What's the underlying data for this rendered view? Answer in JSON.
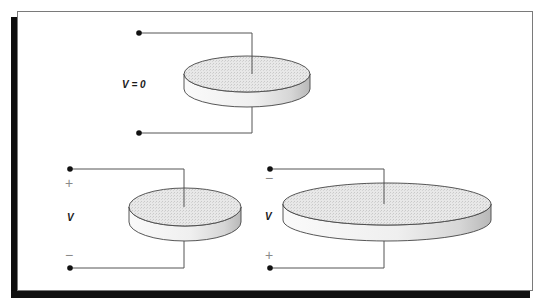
{
  "diagram": {
    "colors": {
      "frame_border": "#7a7a7a",
      "shadow": "#111111",
      "wire": "#555555",
      "terminal_dot": "#111111",
      "disk_top_fill": "#e4e4e4",
      "disk_side_fill": "#f4f4f4",
      "disk_side_shade": "#bdbdbd",
      "disk_outline": "#444444",
      "label": "#1a1a1a",
      "sign": "#8a8a8a"
    },
    "panels": [
      {
        "id": "top",
        "voltage_label": "V = 0",
        "top_sign": "",
        "bottom_sign": "",
        "disk": {
          "cx": 247,
          "cy": 74,
          "rx": 63,
          "ry": 18,
          "thickness": 15
        },
        "wire_x": 252,
        "top_terminal": {
          "x": 139,
          "y": 33
        },
        "bottom_terminal": {
          "x": 139,
          "y": 133
        }
      },
      {
        "id": "bottom-left",
        "voltage_label": "V",
        "top_sign": "+",
        "bottom_sign": "−",
        "disk": {
          "cx": 185,
          "cy": 207,
          "rx": 56,
          "ry": 19,
          "thickness": 15
        },
        "wire_x": 184,
        "top_terminal": {
          "x": 70,
          "y": 169
        },
        "bottom_terminal": {
          "x": 70,
          "y": 268
        }
      },
      {
        "id": "bottom-right",
        "voltage_label": "V",
        "top_sign": "−",
        "bottom_sign": "+",
        "disk": {
          "cx": 387,
          "cy": 204,
          "rx": 104,
          "ry": 21,
          "thickness": 16
        },
        "wire_x": 384,
        "top_terminal": {
          "x": 270,
          "y": 169
        },
        "bottom_terminal": {
          "x": 270,
          "y": 268
        }
      }
    ]
  }
}
